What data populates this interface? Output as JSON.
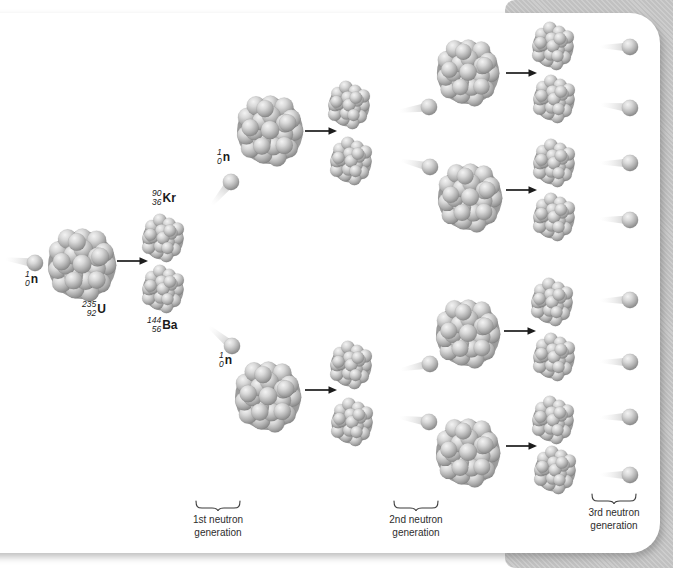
{
  "figure": {
    "type": "nuclear-fission-chain-reaction-diagram",
    "nuclides": {
      "neutron": {
        "mass": "1",
        "atomic": "0",
        "symbol": "n"
      },
      "uranium": {
        "mass": "235",
        "atomic": "92",
        "symbol": "U"
      },
      "krypton": {
        "mass": "90",
        "atomic": "36",
        "symbol": "Kr"
      },
      "barium": {
        "mass": "144",
        "atomic": "56",
        "symbol": "Ba"
      }
    },
    "generation_labels": [
      "1st neutron generation",
      "2nd neutron generation",
      "3rd neutron generation"
    ],
    "colors": {
      "page_background": "#ffffff",
      "accent_panel": "#c6c6c6",
      "sphere_highlight": "#f3f3f3",
      "sphere_mid": "#b2b2b2",
      "sphere_shadow": "#878787",
      "cluster_gap": "#9b9b9b",
      "arrow": "#1c1c1c",
      "text": "#1a1a1a"
    },
    "scene": {
      "large_nuclei": [
        {
          "x": 82,
          "y": 264,
          "r": 36
        },
        {
          "x": 270,
          "y": 130,
          "r": 35
        },
        {
          "x": 268,
          "y": 396,
          "r": 35
        },
        {
          "x": 468,
          "y": 72,
          "r": 33
        },
        {
          "x": 470,
          "y": 197,
          "r": 34
        },
        {
          "x": 468,
          "y": 333,
          "r": 34
        },
        {
          "x": 468,
          "y": 452,
          "r": 34
        }
      ],
      "fragments": [
        {
          "x": 163,
          "y": 238
        },
        {
          "x": 163,
          "y": 289
        },
        {
          "x": 349,
          "y": 105
        },
        {
          "x": 351,
          "y": 161
        },
        {
          "x": 351,
          "y": 365
        },
        {
          "x": 352,
          "y": 422
        },
        {
          "x": 553,
          "y": 46
        },
        {
          "x": 554,
          "y": 99
        },
        {
          "x": 554,
          "y": 163
        },
        {
          "x": 554,
          "y": 217
        },
        {
          "x": 552,
          "y": 302
        },
        {
          "x": 554,
          "y": 357
        },
        {
          "x": 553,
          "y": 420
        },
        {
          "x": 555,
          "y": 470
        }
      ],
      "neutrons": [
        {
          "x": 35,
          "y": 263,
          "trail": 188
        },
        {
          "x": 231,
          "y": 182,
          "trail": 130
        },
        {
          "x": 232,
          "y": 346,
          "trail": 220
        },
        {
          "x": 429,
          "y": 107,
          "trail": 172
        },
        {
          "x": 430,
          "y": 167,
          "trail": 193
        },
        {
          "x": 430,
          "y": 364,
          "trail": 169
        },
        {
          "x": 429,
          "y": 422,
          "trail": 189
        },
        {
          "x": 630,
          "y": 47,
          "trail": 181
        },
        {
          "x": 630,
          "y": 108,
          "trail": 187
        },
        {
          "x": 630,
          "y": 163,
          "trail": 180
        },
        {
          "x": 630,
          "y": 220,
          "trail": 182
        },
        {
          "x": 630,
          "y": 300,
          "trail": 179
        },
        {
          "x": 630,
          "y": 362,
          "trail": 181
        },
        {
          "x": 630,
          "y": 417,
          "trail": 179
        },
        {
          "x": 630,
          "y": 475,
          "trail": 181
        }
      ],
      "arrows": [
        {
          "x1": 117,
          "y1": 261,
          "x2": 148,
          "y2": 261
        },
        {
          "x1": 305,
          "y1": 131,
          "x2": 337,
          "y2": 131
        },
        {
          "x1": 305,
          "y1": 390,
          "x2": 337,
          "y2": 390
        },
        {
          "x1": 506,
          "y1": 73,
          "x2": 537,
          "y2": 73
        },
        {
          "x1": 506,
          "y1": 190,
          "x2": 537,
          "y2": 190
        },
        {
          "x1": 504,
          "y1": 331,
          "x2": 536,
          "y2": 331
        },
        {
          "x1": 506,
          "y1": 446,
          "x2": 537,
          "y2": 446
        }
      ]
    }
  }
}
